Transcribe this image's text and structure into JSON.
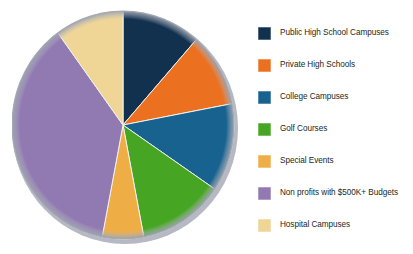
{
  "chart_data": {
    "type": "pie",
    "title": "",
    "xlabel": "",
    "ylabel": "",
    "legend_position": "right",
    "grid": false,
    "categories": [
      "Public High School Campuses",
      "Private High Schools",
      "College Campuses",
      "Golf Courses",
      "Special Events",
      "Non profits with $500K+ Budgets",
      "Hospital Campuses"
    ],
    "values": [
      11.5,
      10.5,
      12.5,
      12.5,
      6,
      37,
      10
    ],
    "colors": [
      "#11314f",
      "#eb7020",
      "#17628f",
      "#46a522",
      "#eead45",
      "#9179b2",
      "#efd596"
    ],
    "start_angle_deg": 0,
    "direction": "clockwise"
  },
  "legend": {
    "items": [
      {
        "label": "Public High School Campuses",
        "color": "#11314f"
      },
      {
        "label": "Private High Schools",
        "color": "#eb7020"
      },
      {
        "label": "College Campuses",
        "color": "#17628f"
      },
      {
        "label": "Golf Courses",
        "color": "#46a522"
      },
      {
        "label": "Special Events",
        "color": "#eead45"
      },
      {
        "label": "Non profits with $500K+ Budgets",
        "color": "#9179b2"
      },
      {
        "label": "Hospital Campuses",
        "color": "#efd596"
      }
    ]
  }
}
